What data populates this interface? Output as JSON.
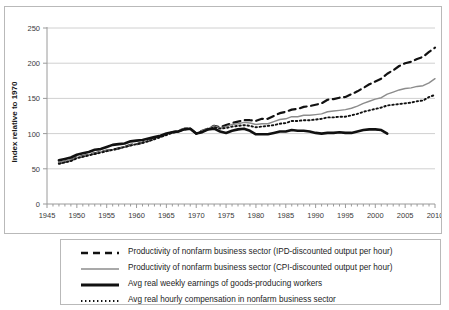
{
  "chart_data": {
    "type": "line",
    "title": "",
    "xlabel": "",
    "ylabel": "Index relative to 1970",
    "xlim": [
      1945,
      2010
    ],
    "ylim": [
      0,
      250
    ],
    "ytick_step": 50,
    "xtick_step": 5,
    "grid": true,
    "legend_position": "bottom",
    "yticks": [
      0,
      50,
      100,
      150,
      200,
      250
    ],
    "xticks": [
      1945,
      1950,
      1955,
      1960,
      1965,
      1970,
      1975,
      1980,
      1985,
      1990,
      1995,
      2000,
      2005,
      2010
    ],
    "series": [
      {
        "name": "Productivity of nonfarm business sector (IPD-discounted output per hour)",
        "style": "dashed",
        "color": "#111111",
        "width": 2.2,
        "x": [
          1947,
          1948,
          1949,
          1950,
          1951,
          1952,
          1953,
          1954,
          1955,
          1956,
          1957,
          1958,
          1959,
          1960,
          1961,
          1962,
          1963,
          1964,
          1965,
          1966,
          1967,
          1968,
          1969,
          1970,
          1971,
          1972,
          1973,
          1974,
          1975,
          1976,
          1977,
          1978,
          1979,
          1980,
          1981,
          1982,
          1983,
          1984,
          1985,
          1986,
          1987,
          1988,
          1989,
          1990,
          1991,
          1992,
          1993,
          1994,
          1995,
          1996,
          1997,
          1998,
          1999,
          2000,
          2001,
          2002,
          2003,
          2004,
          2005,
          2006,
          2007,
          2008,
          2009,
          2010
        ],
        "values": [
          58,
          60,
          62,
          66,
          68,
          70,
          72,
          74,
          76,
          77,
          79,
          81,
          84,
          85,
          87,
          90,
          93,
          96,
          99,
          102,
          104,
          107,
          107,
          100,
          104,
          107,
          111,
          109,
          112,
          115,
          117,
          119,
          119,
          118,
          121,
          121,
          125,
          129,
          131,
          134,
          135,
          138,
          139,
          141,
          143,
          148,
          149,
          151,
          152,
          156,
          160,
          165,
          170,
          174,
          178,
          185,
          190,
          196,
          200,
          202,
          206,
          209,
          216,
          222
        ]
      },
      {
        "name": "Productivity of nonfarm business sector (CPI-discounted output per hour)",
        "style": "solid-thin",
        "color": "#8c8c8c",
        "width": 1.4,
        "x": [
          1947,
          1948,
          1949,
          1950,
          1951,
          1952,
          1953,
          1954,
          1955,
          1956,
          1957,
          1958,
          1959,
          1960,
          1961,
          1962,
          1963,
          1964,
          1965,
          1966,
          1967,
          1968,
          1969,
          1970,
          1971,
          1972,
          1973,
          1974,
          1975,
          1976,
          1977,
          1978,
          1979,
          1980,
          1981,
          1982,
          1983,
          1984,
          1985,
          1986,
          1987,
          1988,
          1989,
          1990,
          1991,
          1992,
          1993,
          1994,
          1995,
          1996,
          1997,
          1998,
          1999,
          2000,
          2001,
          2002,
          2003,
          2004,
          2005,
          2006,
          2007,
          2008,
          2009,
          2010
        ],
        "values": [
          59,
          61,
          63,
          66,
          68,
          70,
          72,
          74,
          76,
          77,
          79,
          81,
          84,
          85,
          87,
          90,
          93,
          96,
          99,
          102,
          104,
          107,
          107,
          100,
          104,
          107,
          111,
          108,
          110,
          113,
          114,
          116,
          115,
          113,
          114,
          114,
          117,
          120,
          121,
          124,
          124,
          126,
          126,
          127,
          128,
          131,
          132,
          133,
          134,
          136,
          139,
          143,
          146,
          149,
          151,
          156,
          159,
          162,
          164,
          165,
          167,
          168,
          172,
          178
        ]
      },
      {
        "name": "Avg real weekly earnings of goods-producing workers",
        "style": "solid-thick",
        "color": "#111111",
        "width": 2.6,
        "x": [
          1947,
          1948,
          1949,
          1950,
          1951,
          1952,
          1953,
          1954,
          1955,
          1956,
          1957,
          1958,
          1959,
          1960,
          1961,
          1962,
          1963,
          1964,
          1965,
          1966,
          1967,
          1968,
          1969,
          1970,
          1971,
          1972,
          1973,
          1974,
          1975,
          1976,
          1977,
          1978,
          1979,
          1980,
          1981,
          1982,
          1983,
          1984,
          1985,
          1986,
          1987,
          1988,
          1989,
          1990,
          1991,
          1992,
          1993,
          1994,
          1995,
          1996,
          1997,
          1998,
          1999,
          2000,
          2001,
          2002
        ],
        "values": [
          62,
          64,
          66,
          70,
          72,
          74,
          77,
          78,
          81,
          84,
          85,
          86,
          89,
          90,
          91,
          93,
          95,
          97,
          100,
          102,
          103,
          106,
          107,
          100,
          102,
          106,
          107,
          103,
          101,
          104,
          106,
          107,
          104,
          99,
          99,
          99,
          101,
          103,
          103,
          105,
          104,
          104,
          103,
          101,
          100,
          101,
          101,
          102,
          101,
          101,
          103,
          105,
          106,
          106,
          105,
          100
        ]
      },
      {
        "name": "Avg real hourly compensation in nonfarm business sector",
        "style": "dotted",
        "color": "#111111",
        "width": 1.9,
        "x": [
          1947,
          1948,
          1949,
          1950,
          1951,
          1952,
          1953,
          1954,
          1955,
          1956,
          1957,
          1958,
          1959,
          1960,
          1961,
          1962,
          1963,
          1964,
          1965,
          1966,
          1967,
          1968,
          1969,
          1970,
          1971,
          1972,
          1973,
          1974,
          1975,
          1976,
          1977,
          1978,
          1979,
          1980,
          1981,
          1982,
          1983,
          1984,
          1985,
          1986,
          1987,
          1988,
          1989,
          1990,
          1991,
          1992,
          1993,
          1994,
          1995,
          1996,
          1997,
          1998,
          1999,
          2000,
          2001,
          2002,
          2003,
          2004,
          2005,
          2006,
          2007,
          2008,
          2009,
          2010
        ],
        "values": [
          57,
          59,
          61,
          65,
          67,
          69,
          71,
          73,
          75,
          77,
          79,
          81,
          83,
          85,
          87,
          89,
          92,
          95,
          98,
          101,
          103,
          106,
          107,
          100,
          103,
          106,
          109,
          107,
          108,
          110,
          111,
          112,
          111,
          109,
          110,
          111,
          112,
          114,
          115,
          118,
          118,
          119,
          119,
          120,
          121,
          123,
          123,
          124,
          124,
          126,
          128,
          131,
          133,
          135,
          137,
          140,
          141,
          142,
          143,
          144,
          146,
          147,
          152,
          155
        ]
      }
    ]
  },
  "legend": {
    "items": [
      {
        "label": "Productivity of nonfarm business sector (IPD-discounted output per hour)",
        "key": "dashed-line-key"
      },
      {
        "label": "Productivity of nonfarm business sector (CPI-discounted output per hour)",
        "key": "thin-gray-line-key"
      },
      {
        "label": "Avg real weekly earnings of goods-producing workers",
        "key": "thick-black-line-key"
      },
      {
        "label": "Avg real hourly compensation in nonfarm business sector",
        "key": "dotted-line-key"
      }
    ]
  }
}
